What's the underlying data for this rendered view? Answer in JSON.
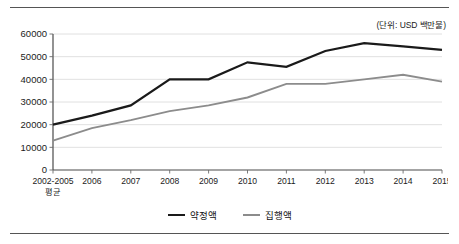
{
  "unit_note": "(단위: USD 백만불)",
  "legend": {
    "items": [
      {
        "label": "약정액",
        "color": "#1a1a1a"
      },
      {
        "label": "집행액",
        "color": "#8c8c8c"
      }
    ]
  },
  "axis": {
    "y_ticks": [
      "0",
      "10000",
      "20000",
      "30000",
      "40000",
      "50000",
      "60000"
    ],
    "x_first_line": "2002-2005",
    "x_first_sub": "평균"
  },
  "chart_data": {
    "type": "line",
    "title": "",
    "subtitle": "",
    "xlabel": "",
    "ylabel": "",
    "annotations": [
      "(단위: USD 백만불)"
    ],
    "grid": "horizontal",
    "legend_position": "bottom-center",
    "ylim": [
      0,
      60000
    ],
    "ytick_step": 10000,
    "categories": [
      "2002-2005 평균",
      "2006",
      "2007",
      "2008",
      "2009",
      "2010",
      "2011",
      "2012",
      "2013",
      "2014",
      "2015"
    ],
    "series": [
      {
        "name": "약정액",
        "color": "#1a1a1a",
        "values": [
          20000,
          24000,
          28500,
          40000,
          40000,
          47500,
          45500,
          52500,
          56000,
          54500,
          53000
        ]
      },
      {
        "name": "집행액",
        "color": "#8c8c8c",
        "values": [
          13000,
          18500,
          22000,
          26000,
          28500,
          32000,
          38000,
          38000,
          40000,
          42000,
          39000
        ]
      }
    ]
  }
}
